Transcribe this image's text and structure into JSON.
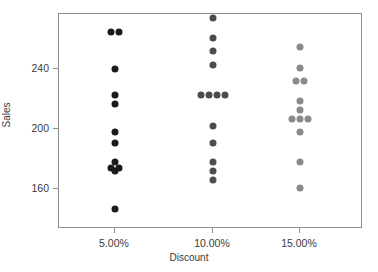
{
  "chart_data": {
    "type": "scatter",
    "title": "",
    "xlabel": "Discount",
    "ylabel": "Sales",
    "categories": [
      "5.00%",
      "10.00%",
      "15.00%"
    ],
    "ytick_labels": [
      "160",
      "200",
      "240"
    ],
    "yticks": [
      160,
      200,
      240
    ],
    "ylim": [
      139,
      282
    ],
    "grid": false,
    "legend": null,
    "series": [
      {
        "name": "5.00%",
        "color": "#1a1a1a",
        "category": "5.00%",
        "points": [
          {
            "x": "5.00%",
            "y": 265,
            "jitter": -4
          },
          {
            "x": "5.00%",
            "y": 265,
            "jitter": 4
          },
          {
            "x": "5.00%",
            "y": 240,
            "jitter": 0
          },
          {
            "x": "5.00%",
            "y": 223,
            "jitter": 0
          },
          {
            "x": "5.00%",
            "y": 217,
            "jitter": 0
          },
          {
            "x": "5.00%",
            "y": 198,
            "jitter": 0
          },
          {
            "x": "5.00%",
            "y": 191,
            "jitter": 0
          },
          {
            "x": "5.00%",
            "y": 178,
            "jitter": 0
          },
          {
            "x": "5.00%",
            "y": 174,
            "jitter": -4
          },
          {
            "x": "5.00%",
            "y": 174,
            "jitter": 4
          },
          {
            "x": "5.00%",
            "y": 172,
            "jitter": 0
          },
          {
            "x": "5.00%",
            "y": 147,
            "jitter": 0
          }
        ]
      },
      {
        "name": "10.00%",
        "color": "#4d4d4d",
        "category": "10.00%",
        "points": [
          {
            "x": "10.00%",
            "y": 274,
            "jitter": 0
          },
          {
            "x": "10.00%",
            "y": 261,
            "jitter": 0
          },
          {
            "x": "10.00%",
            "y": 252,
            "jitter": 0
          },
          {
            "x": "10.00%",
            "y": 243,
            "jitter": 0
          },
          {
            "x": "10.00%",
            "y": 223,
            "jitter": -12
          },
          {
            "x": "10.00%",
            "y": 223,
            "jitter": -4
          },
          {
            "x": "10.00%",
            "y": 223,
            "jitter": 4
          },
          {
            "x": "10.00%",
            "y": 223,
            "jitter": 12
          },
          {
            "x": "10.00%",
            "y": 202,
            "jitter": 0
          },
          {
            "x": "10.00%",
            "y": 191,
            "jitter": 0
          },
          {
            "x": "10.00%",
            "y": 178,
            "jitter": 0
          },
          {
            "x": "10.00%",
            "y": 172,
            "jitter": 0
          },
          {
            "x": "10.00%",
            "y": 166,
            "jitter": 0
          }
        ]
      },
      {
        "name": "15.00%",
        "color": "#8a8a8a",
        "category": "15.00%",
        "points": [
          {
            "x": "15.00%",
            "y": 255,
            "jitter": 0
          },
          {
            "x": "15.00%",
            "y": 241,
            "jitter": 0
          },
          {
            "x": "15.00%",
            "y": 232,
            "jitter": -4
          },
          {
            "x": "15.00%",
            "y": 232,
            "jitter": 4
          },
          {
            "x": "15.00%",
            "y": 219,
            "jitter": 0
          },
          {
            "x": "15.00%",
            "y": 213,
            "jitter": 0
          },
          {
            "x": "15.00%",
            "y": 207,
            "jitter": -8
          },
          {
            "x": "15.00%",
            "y": 207,
            "jitter": 0
          },
          {
            "x": "15.00%",
            "y": 207,
            "jitter": 8
          },
          {
            "x": "15.00%",
            "y": 198,
            "jitter": 0
          },
          {
            "x": "15.00%",
            "y": 178,
            "jitter": 0
          },
          {
            "x": "15.00%",
            "y": 161,
            "jitter": 0
          }
        ]
      }
    ]
  }
}
